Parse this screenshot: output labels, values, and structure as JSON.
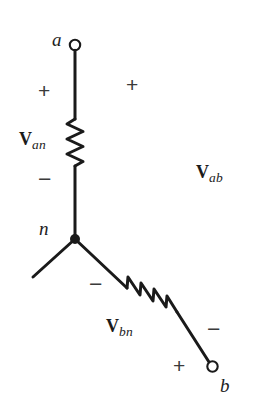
{
  "figure": {
    "type": "circuit-diagram",
    "background_color": "#ffffff",
    "line_color": "#1a1a1a"
  },
  "terminals": [
    {
      "id": "a",
      "label": "a",
      "x": 75,
      "y": 45,
      "open": true
    },
    {
      "id": "b",
      "label": "b",
      "x": 222,
      "y": 374,
      "open": true
    }
  ],
  "nodes": [
    {
      "id": "n",
      "label": "n",
      "x": 75,
      "y": 239,
      "filled": true
    }
  ],
  "components": [
    {
      "id": "resistor-an",
      "type": "resistor",
      "orientation": "vertical",
      "label": {
        "symbol": "V",
        "subscript": "an"
      },
      "polarity_top": "+",
      "polarity_bottom": "−"
    },
    {
      "id": "resistor-bn",
      "type": "resistor",
      "orientation": "diagonal",
      "label": {
        "symbol": "V",
        "subscript": "bn"
      },
      "polarity_near_node": "−",
      "polarity_near_b": "+"
    }
  ],
  "labels": {
    "terminal_a": "a",
    "terminal_b": "b",
    "node_n": "n",
    "v_an_symbol": "V",
    "v_an_sub": "an",
    "v_bn_symbol": "V",
    "v_bn_sub": "bn",
    "v_ab_symbol": "V",
    "v_ab_sub": "ab",
    "plus_an": "+",
    "minus_an": "−",
    "plus_ab": "+",
    "minus_ab": "−",
    "minus_bn": "−",
    "plus_bn": "+"
  }
}
